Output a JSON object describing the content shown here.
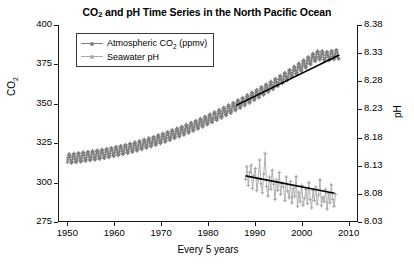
{
  "chart_data": {
    "type": "line",
    "title": "CO2 and pH Time Series in the North Pacific Ocean",
    "title_parts": {
      "pre": "CO",
      "sub": "2",
      "post": " and pH Time Series in the North Pacific Ocean"
    },
    "xlabel": "Every 5 years",
    "ylabel_left_parts": {
      "pre": "CO",
      "sub": "2"
    },
    "ylabel_left": "CO2",
    "ylabel_right": "pH",
    "grid": false,
    "legend_position": "top-left inside",
    "xlim": [
      1948,
      2012
    ],
    "xticks": [
      1950,
      1960,
      1970,
      1980,
      1990,
      2000,
      2010
    ],
    "ylim_left": [
      275,
      400
    ],
    "yticks_left": [
      275,
      300,
      325,
      350,
      375,
      400
    ],
    "ylim_right": [
      8.03,
      8.38
    ],
    "yticks_right": [
      "8.03",
      "8.08",
      "8.13",
      "8.18",
      "8.23",
      "8.28",
      "8.33",
      "8.38"
    ],
    "colors": {
      "co2": "#808080",
      "ph": "#a8a8a8",
      "trend": "#000000",
      "axis": "#1a1a1a"
    },
    "series": [
      {
        "name": "Atmospheric CO2 (ppmv)",
        "name_parts": {
          "pre": "Atmospheric CO",
          "sub": "2",
          "post": " (ppmv)"
        },
        "axis": "left",
        "units": "ppmv",
        "marker": "cross",
        "color": "#808080",
        "note": "monthly values with seasonal oscillation; annual means listed",
        "x": [
          1950,
          1951,
          1952,
          1953,
          1954,
          1955,
          1956,
          1957,
          1958,
          1959,
          1960,
          1961,
          1962,
          1963,
          1964,
          1965,
          1966,
          1967,
          1968,
          1969,
          1970,
          1971,
          1972,
          1973,
          1974,
          1975,
          1976,
          1977,
          1978,
          1979,
          1980,
          1981,
          1982,
          1983,
          1984,
          1985,
          1986,
          1987,
          1988,
          1989,
          1990,
          1991,
          1992,
          1993,
          1994,
          1995,
          1996,
          1997,
          1998,
          1999,
          2000,
          2001,
          2002,
          2003,
          2004,
          2005,
          2006,
          2007,
          2008
        ],
        "values": [
          315.0,
          315.4,
          315.8,
          316.2,
          316.6,
          317.0,
          317.4,
          317.9,
          318.4,
          319.0,
          319.6,
          320.2,
          320.9,
          321.6,
          322.4,
          323.2,
          324.1,
          325.0,
          325.9,
          326.9,
          327.9,
          328.9,
          330.0,
          331.1,
          332.2,
          333.4,
          334.6,
          335.9,
          337.2,
          338.5,
          339.9,
          341.3,
          342.7,
          344.2,
          345.7,
          347.2,
          348.8,
          350.4,
          352.0,
          353.7,
          355.4,
          357.1,
          358.8,
          360.6,
          362.4,
          364.2,
          366.1,
          368.0,
          370.0,
          372.0,
          374.0,
          376.0,
          378.1,
          380.2,
          381.0,
          379.8,
          380.5,
          381.2,
          381.5
        ],
        "seasonal_amplitude_ppmv": 3.0
      },
      {
        "name": "Seawater pH",
        "name_parts": {
          "pre": "Seawater pH",
          "sub": "",
          "post": ""
        },
        "axis": "right",
        "units": "pH",
        "marker": "cross",
        "color": "#a8a8a8",
        "note": "high-frequency noisy record beginning 1988",
        "x": [
          1988.0,
          1988.3,
          1988.6,
          1988.9,
          1989.2,
          1989.5,
          1989.8,
          1990.1,
          1990.4,
          1990.7,
          1991.0,
          1991.3,
          1991.6,
          1991.9,
          1992.2,
          1992.5,
          1992.8,
          1993.1,
          1993.4,
          1993.7,
          1994.0,
          1994.3,
          1994.6,
          1994.9,
          1995.2,
          1995.5,
          1995.8,
          1996.1,
          1996.4,
          1996.7,
          1997.0,
          1997.3,
          1997.6,
          1997.9,
          1998.2,
          1998.5,
          1998.8,
          1999.1,
          1999.4,
          1999.7,
          2000.0,
          2000.3,
          2000.6,
          2000.9,
          2001.2,
          2001.5,
          2001.8,
          2002.1,
          2002.4,
          2002.7,
          2003.0,
          2003.3,
          2003.6,
          2003.9,
          2004.2,
          2004.5,
          2004.8,
          2005.1,
          2005.4,
          2005.7,
          2006.0,
          2006.3,
          2006.6,
          2006.9,
          2007.2
        ],
        "values": [
          8.106,
          8.128,
          8.095,
          8.118,
          8.131,
          8.09,
          8.112,
          8.125,
          8.086,
          8.105,
          8.14,
          8.098,
          8.082,
          8.115,
          8.152,
          8.093,
          8.076,
          8.11,
          8.088,
          8.122,
          8.097,
          8.07,
          8.105,
          8.086,
          8.118,
          8.079,
          8.1,
          8.092,
          8.068,
          8.11,
          8.085,
          8.073,
          8.102,
          8.064,
          8.09,
          8.075,
          8.111,
          8.058,
          8.083,
          8.066,
          8.095,
          8.06,
          8.072,
          8.088,
          8.063,
          8.1,
          8.07,
          8.055,
          8.086,
          8.068,
          8.092,
          8.062,
          8.078,
          8.105,
          8.059,
          8.074,
          8.066,
          8.088,
          8.053,
          8.08,
          8.064,
          8.096,
          8.07,
          8.058,
          8.079
        ]
      },
      {
        "name": "CO2 trend line",
        "axis": "left",
        "color": "#000000",
        "type": "trend",
        "x": [
          1986,
          2008
        ],
        "values": [
          349.0,
          381.0
        ]
      },
      {
        "name": "pH trend line",
        "axis": "right",
        "color": "#000000",
        "type": "trend",
        "x": [
          1988,
          2007
        ],
        "values": [
          8.112,
          8.081
        ]
      }
    ]
  }
}
